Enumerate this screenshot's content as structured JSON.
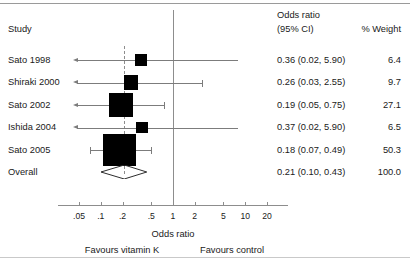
{
  "chart_data": {
    "type": "forest",
    "title": "",
    "xlabel": "Odds ratio",
    "ylabel": "",
    "scale": "log",
    "xlim": [
      0.04,
      25
    ],
    "grid": false,
    "null_value": 1,
    "columns": {
      "study_header": "Study",
      "effect_header_line1": "Odds ratio",
      "effect_header_line2": "(95% CI)",
      "weight_header": "% Weight"
    },
    "tick_labels": [
      ".05",
      ".1",
      ".2",
      ".5",
      "1",
      "2",
      "5",
      "10",
      "20"
    ],
    "tick_values": [
      0.05,
      0.1,
      0.2,
      0.5,
      1,
      2,
      5,
      10,
      20
    ],
    "left_footer": "Favours vitamin K",
    "right_footer": "Favours control",
    "categories": [
      "Sato 1998",
      "Shiraki 2000",
      "Sato 2002",
      "Ishida 2004",
      "Sato 2005"
    ],
    "values": [
      0.36,
      0.26,
      0.19,
      0.37,
      0.18
    ],
    "ci_low": [
      0.02,
      0.03,
      0.05,
      0.02,
      0.07
    ],
    "ci_high": [
      5.9,
      2.55,
      0.75,
      5.9,
      0.49
    ],
    "weights": [
      6.4,
      9.7,
      27.1,
      6.5,
      50.3
    ],
    "overall": {
      "label": "Overall",
      "value": 0.21,
      "ci_low": 0.1,
      "ci_high": 0.43,
      "weight": 100.0,
      "effect_text": "0.21 (0.10, 0.43)",
      "weight_text": "100.0"
    },
    "rows": [
      {
        "study": "Sato 1998",
        "effect_text": "0.36 (0.02, 5.90)",
        "weight_text": "6.4",
        "estimate": 0.36,
        "ci_low": 0.02,
        "ci_high": 5.9,
        "weight": 6.4,
        "left_truncated": true,
        "right_truncated": true
      },
      {
        "study": "Shiraki 2000",
        "effect_text": "0.26 (0.03, 2.55)",
        "weight_text": "9.7",
        "estimate": 0.26,
        "ci_low": 0.03,
        "ci_high": 2.55,
        "weight": 9.7,
        "left_truncated": true,
        "right_truncated": false
      },
      {
        "study": "Sato 2002",
        "effect_text": "0.19 (0.05, 0.75)",
        "weight_text": "27.1",
        "estimate": 0.19,
        "ci_low": 0.05,
        "ci_high": 0.75,
        "weight": 27.1,
        "left_truncated": true,
        "right_truncated": false
      },
      {
        "study": "Ishida 2004",
        "effect_text": "0.37 (0.02, 5.90)",
        "weight_text": "6.5",
        "estimate": 0.37,
        "ci_low": 0.02,
        "ci_high": 5.9,
        "weight": 6.5,
        "left_truncated": true,
        "right_truncated": true
      },
      {
        "study": "Sato 2005",
        "effect_text": "0.18 (0.07, 0.49)",
        "weight_text": "50.3",
        "estimate": 0.18,
        "ci_low": 0.07,
        "ci_high": 0.49,
        "weight": 50.3,
        "left_truncated": false,
        "right_truncated": false
      }
    ],
    "colors": {
      "marker": "#000000",
      "line": "#7c7c7c",
      "axis": "#8d8d8d",
      "text": "#1a1a1a",
      "background": "#ffffff"
    }
  }
}
